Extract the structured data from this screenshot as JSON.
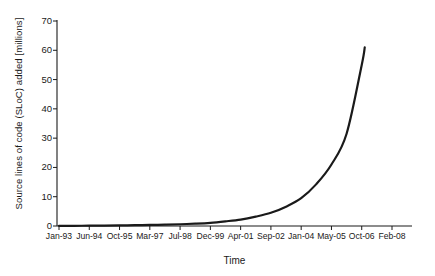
{
  "chart_data": {
    "type": "line",
    "title": "",
    "xlabel": "Time",
    "ylabel": "Source lines of code (SLoC) added [millions]",
    "x_tick_labels": [
      "Jan-93",
      "Jun-94",
      "Oct-95",
      "Mar-97",
      "Jul-98",
      "Dec-99",
      "Apr-01",
      "Sep-02",
      "Jan-04",
      "May-05",
      "Oct-06",
      "Feb-08"
    ],
    "y_tick_labels": [
      "0",
      "10",
      "20",
      "30",
      "40",
      "50",
      "60",
      "70"
    ],
    "ylim": [
      0,
      70
    ],
    "ytick_step": 10,
    "grid": false,
    "legend": false,
    "line_color": "#1a1a1a",
    "line_width": 2.2,
    "series": [
      {
        "name": "Source lines of code added",
        "x": [
          "Jan-93",
          "Jun-94",
          "Oct-95",
          "Mar-97",
          "Jul-98",
          "Dec-99",
          "Apr-01",
          "Sep-02",
          "Jan-04",
          "May-05",
          "Oct-06"
        ],
        "values": [
          0.05,
          0.1,
          0.2,
          0.35,
          0.6,
          1.1,
          2.2,
          4.5,
          9.5,
          21.0,
          55.0
        ],
        "end_value": 61,
        "end_label": "Oct-06"
      }
    ],
    "points": [
      {
        "x": 0.0,
        "y": 0.05
      },
      {
        "x": 0.5,
        "y": 0.07
      },
      {
        "x": 1.0,
        "y": 0.1
      },
      {
        "x": 1.5,
        "y": 0.14
      },
      {
        "x": 2.0,
        "y": 0.2
      },
      {
        "x": 2.5,
        "y": 0.27
      },
      {
        "x": 3.0,
        "y": 0.35
      },
      {
        "x": 3.5,
        "y": 0.45
      },
      {
        "x": 4.0,
        "y": 0.6
      },
      {
        "x": 4.5,
        "y": 0.8
      },
      {
        "x": 5.0,
        "y": 1.1
      },
      {
        "x": 5.5,
        "y": 1.6
      },
      {
        "x": 6.0,
        "y": 2.2
      },
      {
        "x": 6.5,
        "y": 3.2
      },
      {
        "x": 7.0,
        "y": 4.5
      },
      {
        "x": 7.5,
        "y": 6.6
      },
      {
        "x": 8.0,
        "y": 9.5
      },
      {
        "x": 8.5,
        "y": 14.3
      },
      {
        "x": 9.0,
        "y": 21.0
      },
      {
        "x": 9.5,
        "y": 31.5
      },
      {
        "x": 10.0,
        "y": 55.0
      },
      {
        "x": 10.1,
        "y": 61.0
      }
    ]
  },
  "axes": {
    "x_title": "Time",
    "y_title": "Source lines of code (SLoC) added [millions]"
  }
}
